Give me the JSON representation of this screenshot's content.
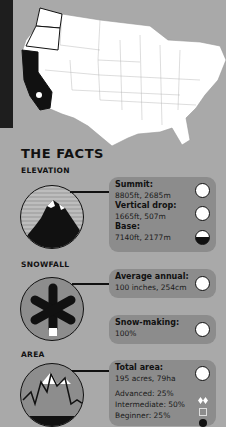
{
  "map": {
    "highlighted_state": "California",
    "outlined_states": [
      "Washington",
      "Oregon"
    ],
    "marker": "resort-location-icon"
  },
  "title": "THE FACTS",
  "elevation": {
    "label": "ELEVATION",
    "summit_label": "Summit:",
    "summit_value": "8805ft, 2685m",
    "drop_label": "Vertical drop:",
    "drop_value": "1665ft, 507m",
    "base_label": "Base:",
    "base_value": "7140ft, 2177m"
  },
  "snowfall": {
    "label": "SNOWFALL",
    "average_label": "Average annual:",
    "average_value": "100 inches, 254cm",
    "snowmaking_label": "Snow-making:",
    "snowmaking_value": "100%"
  },
  "area": {
    "label": "AREA",
    "total_label": "Total area:",
    "total_value": "195 acres, 79ha",
    "advanced": "Advanced: 25%",
    "intermediate": "Intermediate: 50%",
    "beginner": "Beginner: 25%"
  },
  "colors": {
    "background": "#a9a9a9",
    "box": "#8c8c8c",
    "ink": "#111111"
  }
}
